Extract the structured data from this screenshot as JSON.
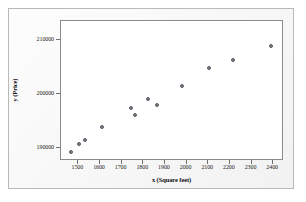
{
  "chart_data": {
    "type": "scatter",
    "title": "",
    "xlabel": "x (Square feet)",
    "ylabel": "y (Price)",
    "xlim": [
      1420,
      2450
    ],
    "ylim": [
      187500,
      213500
    ],
    "grid": false,
    "legend": null,
    "xticks": [
      1500,
      1600,
      1700,
      1800,
      1900,
      2000,
      2100,
      2200,
      2300,
      2400
    ],
    "xtick_labels": [
      "1500",
      "1600",
      "1700",
      "1800",
      "1900",
      "2000",
      "2100",
      "2200",
      "2300",
      "2400"
    ],
    "yticks": [
      190000,
      200000,
      210000
    ],
    "ytick_labels": [
      "190000",
      "200000",
      "210000"
    ],
    "marker": {
      "shape": "circle",
      "fill_color": "#7a7a82",
      "edge_color": "#5d5d66",
      "size_px": 4
    },
    "points": [
      {
        "x": 1465,
        "y": 189250
      },
      {
        "x": 1505,
        "y": 190600
      },
      {
        "x": 1530,
        "y": 191400
      },
      {
        "x": 1610,
        "y": 193900
      },
      {
        "x": 1745,
        "y": 197300
      },
      {
        "x": 1760,
        "y": 196100
      },
      {
        "x": 1820,
        "y": 199100
      },
      {
        "x": 1865,
        "y": 197950
      },
      {
        "x": 1980,
        "y": 201450
      },
      {
        "x": 2105,
        "y": 204750
      },
      {
        "x": 2215,
        "y": 206250
      },
      {
        "x": 2390,
        "y": 208900
      }
    ],
    "n_points": 12,
    "relationship": "positive linear"
  },
  "figure": {
    "background_color": "#ffffff",
    "panel_background": "#f7f7f7",
    "plot_background": "#ffffff",
    "outer_border_color": "#b9b9b9",
    "plot_border_color": "#8a8a8a",
    "axis_text_color": "#1b1b1b"
  }
}
